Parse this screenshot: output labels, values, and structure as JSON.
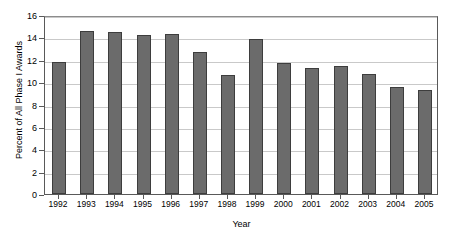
{
  "chart_data": {
    "type": "bar",
    "title": "",
    "xlabel": "Year",
    "ylabel": "Percent of All Phase I Awards",
    "categories": [
      "1992",
      "1993",
      "1994",
      "1995",
      "1996",
      "1997",
      "1998",
      "1999",
      "2000",
      "2001",
      "2002",
      "2003",
      "2004",
      "2005"
    ],
    "values": [
      11.8,
      14.6,
      14.5,
      14.2,
      14.3,
      12.7,
      10.6,
      13.9,
      11.7,
      11.3,
      11.4,
      10.7,
      9.6,
      9.3
    ],
    "ylim": [
      0,
      16
    ],
    "ytick_labels": [
      "0",
      "2",
      "4",
      "6",
      "8",
      "10",
      "12",
      "14",
      "16"
    ],
    "ytick_values": [
      0,
      2,
      4,
      6,
      8,
      10,
      12,
      14,
      16
    ],
    "grid": true,
    "legend": false,
    "bar_color": "#6b6b6b",
    "bar_border_color": "#3d3d3d",
    "grid_color": "#c9c9c9",
    "axis_color": "#595959",
    "background": "#ffffff"
  }
}
